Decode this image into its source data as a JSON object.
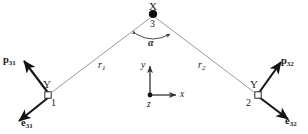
{
  "figure": {
    "background_color": "#ffffff",
    "bond_line_color": "#9a9a9a",
    "vector_color": "#141414",
    "text_color": "#1a1a1a"
  },
  "atoms": {
    "apex": {
      "element": "X",
      "index": "3",
      "marker": "filled-circle",
      "x": 153,
      "y": 14
    },
    "left": {
      "element": "Y",
      "index": "1",
      "marker": "open-square",
      "x": 48,
      "y": 95
    },
    "right": {
      "element": "Y",
      "index": "2",
      "marker": "open-square",
      "x": 258,
      "y": 95
    }
  },
  "bonds": [
    {
      "name": "left-bond",
      "label": "r",
      "subscript": "1",
      "from": "left",
      "to": "apex"
    },
    {
      "name": "right-bond",
      "label": "r",
      "subscript": "2",
      "from": "right",
      "to": "apex"
    }
  ],
  "angle": {
    "symbol": "α",
    "description": "bond angle at apex atom X between r1 and r2",
    "arrow_style": "double-headed-arc"
  },
  "vectors": [
    {
      "name": "p31",
      "label": "p",
      "subscript": "31",
      "direction": "upper-left",
      "at_atom": "left"
    },
    {
      "name": "e31",
      "label": "e",
      "subscript": "31",
      "direction": "lower-left",
      "at_atom": "left"
    },
    {
      "name": "p32",
      "label": "p",
      "subscript": "32",
      "direction": "upper-right",
      "at_atom": "right"
    },
    {
      "name": "e32",
      "label": "e",
      "subscript": "32",
      "direction": "lower-right",
      "at_atom": "right"
    }
  ],
  "axes": {
    "origin": {
      "x": 150,
      "y": 95
    },
    "x_label": "x",
    "y_label": "y",
    "z_label": "z",
    "z_marker": "filled-circle-out-of-plane"
  }
}
